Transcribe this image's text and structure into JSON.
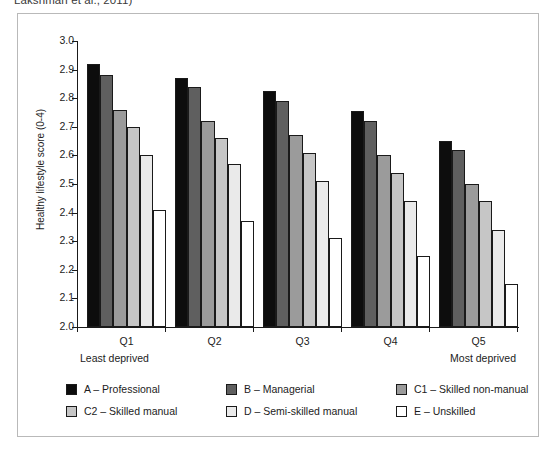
{
  "caption_clip": "Lakshman et al., 2011)",
  "chart_data": {
    "type": "bar",
    "title": "",
    "xlabel": "",
    "ylabel": "Healthy lifestyle score (0-4)",
    "ylim": [
      2.0,
      3.0
    ],
    "ytick_labels": [
      "3.0",
      "2.9",
      "2.8",
      "2.7",
      "2.6",
      "2.5",
      "2.4",
      "2.3",
      "2.2",
      "2.1",
      "2.0"
    ],
    "ytick_values": [
      3.0,
      2.9,
      2.8,
      2.7,
      2.6,
      2.5,
      2.4,
      2.3,
      2.2,
      2.1,
      2.0
    ],
    "grid": false,
    "legend_position": "below",
    "categories": [
      "Q1",
      "Q2",
      "Q3",
      "Q4",
      "Q5"
    ],
    "axis_end_labels": {
      "left": "Least deprived",
      "right": "Most deprived"
    },
    "series": [
      {
        "name": "A – Professional",
        "key": "A",
        "color": "#0d0d0d",
        "values": [
          2.92,
          2.87,
          2.825,
          2.755,
          2.65
        ]
      },
      {
        "name": "B – Managerial",
        "key": "B",
        "color": "#5f5f5f",
        "values": [
          2.88,
          2.84,
          2.79,
          2.72,
          2.62
        ]
      },
      {
        "name": "C1 – Skilled non-manual",
        "key": "C1",
        "color": "#9b9b9b",
        "values": [
          2.76,
          2.72,
          2.67,
          2.6,
          2.5
        ]
      },
      {
        "name": "C2 – Skilled manual",
        "key": "C2",
        "color": "#c6c6c6",
        "values": [
          2.7,
          2.66,
          2.61,
          2.54,
          2.44
        ]
      },
      {
        "name": "D – Semi-skilled manual",
        "key": "D",
        "color": "#eaeaea",
        "values": [
          2.6,
          2.57,
          2.51,
          2.44,
          2.34
        ]
      },
      {
        "name": "E – Unskilled",
        "key": "E",
        "color": "#ffffff",
        "values": [
          2.41,
          2.37,
          2.31,
          2.25,
          2.15
        ]
      }
    ]
  },
  "legend": {
    "rows": [
      [
        {
          "label": "A – Professional",
          "color": "#0d0d0d"
        },
        {
          "label": "B – Managerial",
          "color": "#5f5f5f"
        },
        {
          "label": "C1 – Skilled non-manual",
          "color": "#9b9b9b"
        }
      ],
      [
        {
          "label": "C2 – Skilled manual",
          "color": "#c6c6c6"
        },
        {
          "label": "D – Semi-skilled manual",
          "color": "#eaeaea"
        },
        {
          "label": "E – Unskilled",
          "color": "#ffffff"
        }
      ]
    ]
  }
}
